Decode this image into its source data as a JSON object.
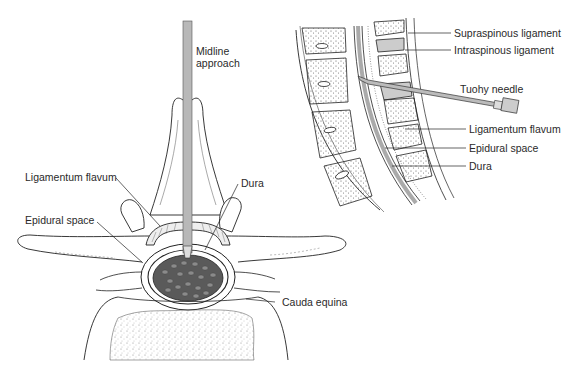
{
  "figure": {
    "colors": {
      "line": "#222222",
      "needle_fill": "#b8b8b8",
      "cord_fill": "#555555",
      "background": "#ffffff"
    }
  },
  "axial_view": {
    "labels": {
      "midline_line1": "Midline",
      "midline_line2": "approach",
      "ligamentum_flavum": "Ligamentum flavum",
      "dura": "Dura",
      "epidural_space": "Epidural space",
      "cauda_equina": "Cauda equina"
    }
  },
  "sagittal_view": {
    "labels": {
      "supraspinous_ligament": "Supraspinous ligament",
      "intraspinous_ligament": "Intraspinous ligament",
      "tuohy_needle": "Tuohy needle",
      "ligamentum_flavum": "Ligamentum flavum",
      "epidural_space": "Epidural space",
      "dura": "Dura"
    }
  }
}
